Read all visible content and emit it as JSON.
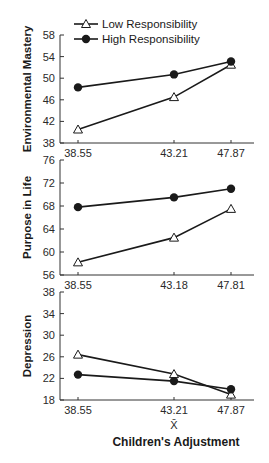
{
  "legend": {
    "low_label": "Low Responsibility",
    "high_label": "High Responsibility"
  },
  "xaxis_title": "Children's Adjustment",
  "xbar_symbol": "X̄",
  "panels": [
    {
      "ylabel": "Environmental Mastery",
      "yticks": [
        "58",
        "54",
        "50",
        "46",
        "42",
        "38"
      ],
      "xticks": [
        "38.55",
        "43.21",
        "47.87"
      ]
    },
    {
      "ylabel": "Purpose in Life",
      "yticks": [
        "76",
        "72",
        "68",
        "64",
        "60",
        "56"
      ],
      "xticks": [
        "38.55",
        "43.18",
        "47.81"
      ]
    },
    {
      "ylabel": "Depression",
      "yticks": [
        "38",
        "34",
        "30",
        "26",
        "22",
        "18"
      ],
      "xticks": [
        "38.55",
        "43.21",
        "47.87"
      ]
    }
  ],
  "chart_data": [
    {
      "type": "line",
      "title": "",
      "xlabel": "",
      "ylabel": "Environmental Mastery",
      "categories": [
        "38.55",
        "43.21",
        "47.87"
      ],
      "ylim": [
        38,
        58
      ],
      "series": [
        {
          "name": "Low Responsibility",
          "marker": "open-triangle",
          "values": [
            40.5,
            46.5,
            52.5
          ]
        },
        {
          "name": "High Responsibility",
          "marker": "filled-circle",
          "values": [
            48.3,
            50.7,
            53.1
          ]
        }
      ],
      "legend_position": "top"
    },
    {
      "type": "line",
      "title": "",
      "xlabel": "",
      "ylabel": "Purpose in Life",
      "categories": [
        "38.55",
        "43.18",
        "47.81"
      ],
      "ylim": [
        56,
        76
      ],
      "series": [
        {
          "name": "Low Responsibility",
          "marker": "open-triangle",
          "values": [
            58.2,
            62.5,
            67.5
          ]
        },
        {
          "name": "High Responsibility",
          "marker": "filled-circle",
          "values": [
            67.8,
            69.5,
            71.0
          ]
        }
      ]
    },
    {
      "type": "line",
      "title": "",
      "xlabel": "Children's Adjustment (X̄)",
      "ylabel": "Depression",
      "categories": [
        "38.55",
        "43.21",
        "47.87"
      ],
      "ylim": [
        18,
        38
      ],
      "series": [
        {
          "name": "Low Responsibility",
          "marker": "open-triangle",
          "values": [
            26.4,
            22.8,
            19.0
          ]
        },
        {
          "name": "High Responsibility",
          "marker": "filled-circle",
          "values": [
            22.7,
            21.5,
            20.0
          ]
        }
      ]
    }
  ]
}
